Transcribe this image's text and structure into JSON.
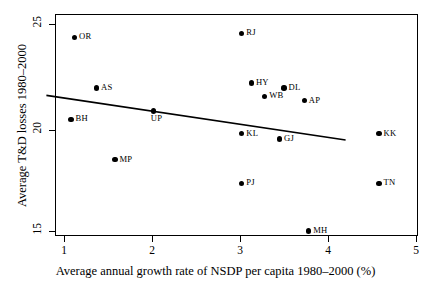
{
  "chart_data": {
    "type": "scatter",
    "title": "",
    "xlabel": "Average annual growth rate of NSDP per capita 1980–2000 (%)",
    "ylabel": "Average T&D losses 1980–2000",
    "xlim": [
      0.55,
      5.05
    ],
    "ylim": [
      14.0,
      25.55
    ],
    "xticks": [
      1,
      2,
      3,
      4,
      5
    ],
    "xtick_labels": [
      "1",
      "2",
      "3",
      "4",
      "5"
    ],
    "yticks": [
      15,
      20,
      25
    ],
    "ytick_labels": [
      "15",
      "20",
      "25"
    ],
    "grid": false,
    "legend": null,
    "marker": "filled-circle",
    "marker_color": "#000000",
    "points": [
      {
        "label": "OR",
        "x": 1.12,
        "y": 24.35,
        "label_pos": "right"
      },
      {
        "label": "RJ",
        "x": 3.02,
        "y": 24.55,
        "label_pos": "right"
      },
      {
        "label": "HY",
        "x": 3.13,
        "y": 22.15,
        "label_pos": "right"
      },
      {
        "label": "DL",
        "x": 3.5,
        "y": 21.9,
        "label_pos": "right"
      },
      {
        "label": "AS",
        "x": 1.37,
        "y": 21.9,
        "label_pos": "right"
      },
      {
        "label": "WB",
        "x": 3.28,
        "y": 21.5,
        "label_pos": "right"
      },
      {
        "label": "AP",
        "x": 3.73,
        "y": 21.3,
        "label_pos": "right"
      },
      {
        "label": "UP",
        "x": 2.02,
        "y": 20.8,
        "label_pos": "below"
      },
      {
        "label": "BH",
        "x": 1.08,
        "y": 20.4,
        "label_pos": "right"
      },
      {
        "label": "KL",
        "x": 3.02,
        "y": 19.7,
        "label_pos": "right"
      },
      {
        "label": "KK",
        "x": 4.58,
        "y": 19.7,
        "label_pos": "right"
      },
      {
        "label": "GJ",
        "x": 3.45,
        "y": 19.45,
        "label_pos": "right"
      },
      {
        "label": "MP",
        "x": 1.58,
        "y": 18.45,
        "label_pos": "right"
      },
      {
        "label": "PJ",
        "x": 3.02,
        "y": 17.3,
        "label_pos": "right"
      },
      {
        "label": "TN",
        "x": 4.58,
        "y": 17.3,
        "label_pos": "right"
      },
      {
        "label": "MH",
        "x": 3.78,
        "y": 15.0,
        "label_pos": "right"
      }
    ],
    "trend_line": {
      "type": "linear-fit",
      "color": "#000000",
      "x_start": 0.8,
      "y_start": 21.55,
      "x_end": 4.2,
      "y_end": 19.4
    }
  }
}
